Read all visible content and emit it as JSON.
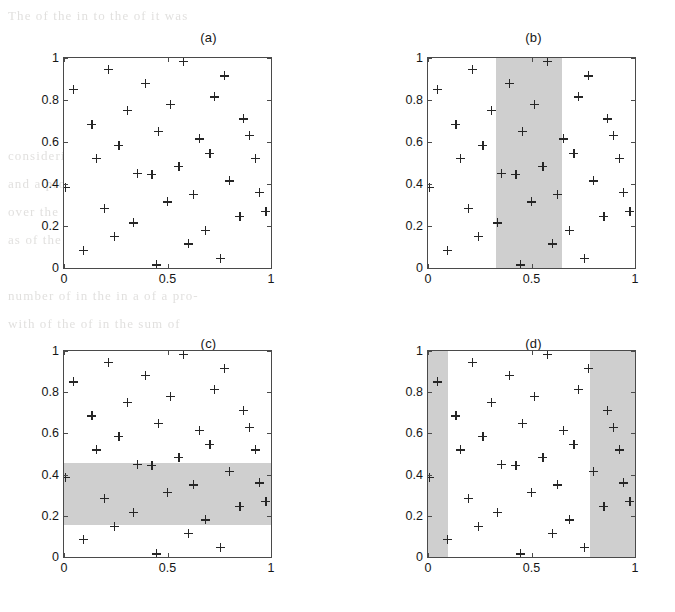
{
  "figure": {
    "background_note": "scanned book page with faint text bleed-through",
    "marker": "plus",
    "marker_color": "#262626",
    "axis_color": "#4a4a4a",
    "shade_color": "#cfcfcf",
    "page_bleed_lines": [
      "The     of the     in     to the     of     it was",
      "",
      "",
      "",
      "",
      "considering     a     set of     points     where the",
      "and     a     problem     over a     of     dimension",
      "over     the     as a     of the     of     we can",
      "as     of     the     with     a     one per     in",
      "",
      "number of     in the     in     a     of a     pro-",
      "with     of     the     of     in     the     sum     of",
      "",
      "",
      "",
      "",
      "",
      "",
      "",
      "",
      ""
    ]
  },
  "chart_data": [
    {
      "type": "scatter",
      "title": "(a)",
      "xlabel": "",
      "ylabel": "",
      "xlim": [
        0,
        1
      ],
      "ylim": [
        0,
        1
      ],
      "xticks": [
        0,
        0.5,
        1
      ],
      "xticklabels": [
        "0",
        "0.5",
        "1"
      ],
      "yticks": [
        0,
        0.2,
        0.4,
        0.6,
        0.8,
        1
      ],
      "yticklabels": [
        "0",
        "0.2",
        "0.4",
        "0.6",
        "0.8",
        "1"
      ],
      "grid": false,
      "legend": null,
      "shaded_regions": [],
      "series": [
        {
          "name": "points",
          "marker": "+",
          "x": [
            0.005,
            0.045,
            0.095,
            0.135,
            0.155,
            0.195,
            0.215,
            0.245,
            0.265,
            0.305,
            0.335,
            0.355,
            0.395,
            0.425,
            0.445,
            0.455,
            0.5,
            0.515,
            0.555,
            0.575,
            0.6,
            0.625,
            0.655,
            0.685,
            0.705,
            0.725,
            0.755,
            0.775,
            0.8,
            0.85,
            0.865,
            0.895,
            0.925,
            0.945,
            0.975
          ],
          "y": [
            0.385,
            0.85,
            0.085,
            0.685,
            0.52,
            0.285,
            0.945,
            0.15,
            0.585,
            0.75,
            0.215,
            0.45,
            0.88,
            0.445,
            0.015,
            0.65,
            0.315,
            0.78,
            0.485,
            0.985,
            0.115,
            0.35,
            0.615,
            0.18,
            0.545,
            0.815,
            0.045,
            0.915,
            0.415,
            0.245,
            0.71,
            0.63,
            0.52,
            0.36,
            0.27
          ]
        }
      ]
    },
    {
      "type": "scatter",
      "title": "(b)",
      "xlim": [
        0,
        1
      ],
      "ylim": [
        0,
        1
      ],
      "xticks": [
        0,
        0.5,
        1
      ],
      "xticklabels": [
        "0",
        "0.5",
        "1"
      ],
      "yticks": [
        0,
        0.2,
        0.4,
        0.6,
        0.8,
        1
      ],
      "yticklabels": [
        "0",
        "0.2",
        "0.4",
        "0.6",
        "0.8",
        "1"
      ],
      "grid": false,
      "legend": null,
      "shaded_regions": [
        {
          "orientation": "vertical",
          "x0": 0.33,
          "x1": 0.645,
          "y0": 0,
          "y1": 1,
          "color": "#cfcfcf"
        }
      ]
    },
    {
      "type": "scatter",
      "title": "(c)",
      "xlim": [
        0,
        1
      ],
      "ylim": [
        0,
        1
      ],
      "xticks": [
        0,
        0.5,
        1
      ],
      "xticklabels": [
        "0",
        "0.5",
        "1"
      ],
      "yticks": [
        0,
        0.2,
        0.4,
        0.6,
        0.8,
        1
      ],
      "yticklabels": [
        "0",
        "0.2",
        "0.4",
        "0.6",
        "0.8",
        "1"
      ],
      "grid": false,
      "legend": null,
      "shaded_regions": [
        {
          "orientation": "horizontal",
          "x0": 0,
          "x1": 1,
          "y0": 0.155,
          "y1": 0.455,
          "color": "#cfcfcf"
        }
      ]
    },
    {
      "type": "scatter",
      "title": "(d)",
      "xlim": [
        0,
        1
      ],
      "ylim": [
        0,
        1
      ],
      "xticks": [
        0,
        0.5,
        1
      ],
      "xticklabels": [
        "0",
        "0.5",
        "1"
      ],
      "yticks": [
        0,
        0.2,
        0.4,
        0.6,
        0.8,
        1
      ],
      "yticklabels": [
        "0",
        "0.2",
        "0.4",
        "0.6",
        "0.8",
        "1"
      ],
      "grid": false,
      "legend": null,
      "shaded_regions": [
        {
          "orientation": "vertical",
          "x0": 0.0,
          "x1": 0.095,
          "y0": 0,
          "y1": 1,
          "color": "#cfcfcf"
        },
        {
          "orientation": "vertical",
          "x0": 0.785,
          "x1": 1.0,
          "y0": 0,
          "y1": 1,
          "color": "#cfcfcf"
        }
      ]
    }
  ]
}
